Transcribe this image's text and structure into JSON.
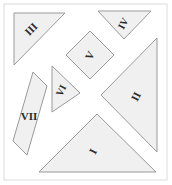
{
  "figure": {
    "width": 172,
    "height": 185,
    "background_color": "#ffffff",
    "frame": {
      "color": "#dcdcdc",
      "stroke_width": 1,
      "x": 4,
      "y": 4,
      "width": 163,
      "height": 176
    },
    "piece_fill_color": "#f0f0f0",
    "piece_stroke_color": "#9a9a9a",
    "piece_stroke_width": 1,
    "label_color": "#2b2b2b"
  },
  "pieces": [
    {
      "id": "piece-1",
      "label": "I",
      "shape": "large-triangle",
      "points": "39,172 156,172 97,114",
      "label_x": 94,
      "label_y": 152,
      "label_rotation": -62,
      "label_size": 11
    },
    {
      "id": "piece-2",
      "label": "II",
      "shape": "large-triangle",
      "points": "157,38 157,152 101,95",
      "label_x": 137,
      "label_y": 97,
      "label_rotation": -62,
      "label_size": 11
    },
    {
      "id": "piece-3",
      "label": "III",
      "shape": "medium-triangle",
      "points": "14,13 65,13 14,65",
      "label_x": 32,
      "label_y": 30,
      "label_rotation": -45,
      "label_size": 11
    },
    {
      "id": "piece-4",
      "label": "IV",
      "shape": "small-triangle",
      "points": "98,11 151,11 124,39",
      "label_x": 124,
      "label_y": 24,
      "label_rotation": -62,
      "label_size": 10
    },
    {
      "id": "piece-5",
      "label": "V",
      "shape": "square",
      "points": "90,31 114,55 90,79 66,55",
      "label_x": 91,
      "label_y": 56,
      "label_rotation": -62,
      "label_size": 11
    },
    {
      "id": "piece-6",
      "label": "VI",
      "shape": "small-triangle",
      "points": "52,66 80,93 52,112",
      "label_x": 62,
      "label_y": 91,
      "label_rotation": -62,
      "label_size": 10
    },
    {
      "id": "piece-7",
      "label": "VII",
      "shape": "parallelogram",
      "points": "33,72 47,86 27,155 13,141",
      "label_x": 29,
      "label_y": 117,
      "label_rotation": 0,
      "label_size": 11
    }
  ]
}
